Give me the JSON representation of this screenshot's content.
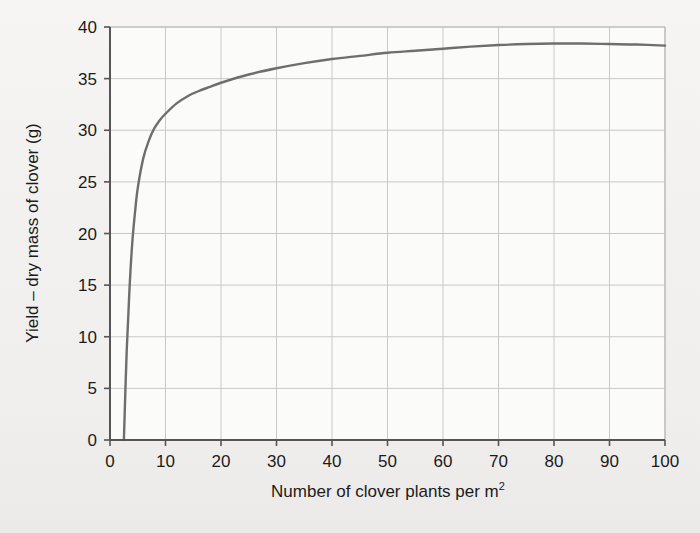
{
  "chart_data": {
    "type": "line",
    "title": "",
    "xlabel": "Number of clover plants per m",
    "xlabel_sup": "2",
    "ylabel": "Yield – dry mass of clover (g)",
    "xlim": [
      0,
      100
    ],
    "ylim": [
      0,
      40
    ],
    "xticks": [
      0,
      10,
      20,
      30,
      40,
      50,
      60,
      70,
      80,
      90,
      100
    ],
    "yticks": [
      0,
      5,
      10,
      15,
      20,
      25,
      30,
      35,
      40
    ],
    "xtick_labels": [
      "0",
      "10",
      "20",
      "30",
      "40",
      "50",
      "60",
      "70",
      "80",
      "90",
      "100"
    ],
    "ytick_labels": [
      "0",
      "5",
      "10",
      "15",
      "20",
      "25",
      "30",
      "35",
      "40"
    ],
    "grid": true,
    "legend": false,
    "series": [
      {
        "name": "Yield",
        "x": [
          2.5,
          3,
          3.5,
          4,
          4.5,
          5,
          6,
          7,
          8,
          9,
          10,
          12,
          14,
          16,
          18,
          20,
          25,
          30,
          35,
          40,
          45,
          50,
          55,
          60,
          65,
          70,
          75,
          80,
          85,
          90,
          95,
          100
        ],
        "y": [
          0,
          8.5,
          14.5,
          19,
          22,
          24.4,
          27.3,
          29.0,
          30.2,
          31.0,
          31.6,
          32.6,
          33.3,
          33.8,
          34.2,
          34.6,
          35.4,
          36.0,
          36.5,
          36.9,
          37.2,
          37.5,
          37.7,
          37.9,
          38.1,
          38.25,
          38.35,
          38.4,
          38.4,
          38.35,
          38.3,
          38.2
        ]
      }
    ],
    "curve_color": "#6e6e6e",
    "grid_color": "#c9c9c9",
    "axis_color": "#555555",
    "text_color": "#1b1b1b",
    "background_color": "#f3f2f0",
    "annotations": []
  }
}
